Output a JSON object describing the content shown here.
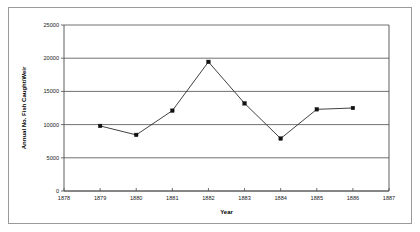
{
  "chart_data": {
    "type": "line",
    "title": "",
    "xlabel": "Year",
    "ylabel": "Annual No. Fish Caught/Weir",
    "x": [
      1879,
      1880,
      1881,
      1882,
      1883,
      1884,
      1885,
      1886
    ],
    "values": [
      9800,
      8450,
      12100,
      19450,
      13200,
      7900,
      12300,
      12500
    ],
    "series": [
      {
        "name": "Annual No. Fish Caught/Weir",
        "x": [
          1879,
          1880,
          1881,
          1882,
          1883,
          1884,
          1885,
          1886
        ],
        "values": [
          9800,
          8450,
          12100,
          19450,
          13200,
          7900,
          12300,
          12500
        ]
      }
    ],
    "xlim": [
      1878,
      1887
    ],
    "ylim": [
      0,
      25000
    ],
    "xticks": [
      1878,
      1879,
      1880,
      1881,
      1882,
      1883,
      1884,
      1885,
      1886,
      1887
    ],
    "xtick_labels": [
      "1878",
      "1879",
      "1880",
      "1881",
      "1882",
      "1883",
      "1884",
      "1885",
      "1886",
      "1887"
    ],
    "yticks": [
      0,
      5000,
      10000,
      15000,
      20000,
      25000
    ],
    "ytick_labels": [
      "0",
      "5000",
      "10000",
      "15000",
      "20000",
      "25000"
    ],
    "grid": "horizontal",
    "legend": "none",
    "marker": "square",
    "line_color": "#2b2b2b",
    "marker_color": "#111111",
    "grid_color": "#4d4d4d",
    "background_color": "#ffffff",
    "border_color": "#9a9a9a"
  }
}
